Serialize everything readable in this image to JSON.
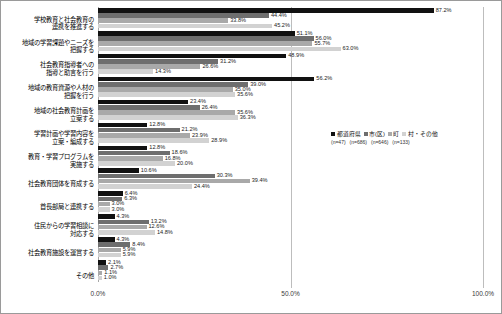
{
  "chart_data": {
    "type": "bar",
    "orientation": "horizontal",
    "title": "",
    "xlabel": "",
    "ylabel": "",
    "xlim": [
      0,
      100
    ],
    "xticks": [
      "0.0%",
      "50.0%",
      "100.0%"
    ],
    "xtick_values": [
      0,
      50,
      100
    ],
    "grid": true,
    "legend_position": "right-middle",
    "categories": [
      "学校教育と社会教育の\n連携を推進する",
      "地域の学習課題やニーズを\n把握する",
      "社会教育指導者への\n指導と助言を行う",
      "地域の教育資源や人材の\n把握を行う",
      "地域の社会教育計画を\n立案する",
      "学習計画や学習内容を\n立案・編成する",
      "教育・学習プログラムを\n実施する",
      "社会教育団体を育成する",
      "首長部局と連携する",
      "住民からの学習相談に\n対応する",
      "社会教育施設を運営する",
      "その他"
    ],
    "series": [
      {
        "name": "都道府県",
        "n_label": "(n=47)",
        "color": "#111111",
        "values": [
          87.2,
          51.1,
          48.9,
          56.2,
          23.4,
          12.8,
          12.8,
          10.6,
          6.4,
          4.3,
          4.3,
          2.1
        ],
        "value_labels": [
          "87.2%",
          "51.1%",
          "48.9%",
          "56.2%",
          "23.4%",
          "12.8%",
          "12.8%",
          "10.6%",
          "6.4%",
          "4.3%",
          "4.3%",
          "2.1%"
        ]
      },
      {
        "name": "市(区)",
        "n_label": "(n=686)",
        "color": "#6e6e6e",
        "values": [
          44.4,
          56.0,
          31.2,
          39.0,
          26.4,
          21.2,
          18.6,
          30.3,
          6.3,
          13.2,
          8.4,
          2.7
        ],
        "value_labels": [
          "44.4%",
          "56.0%",
          "31.2%",
          "39.0%",
          "26.4%",
          "21.2%",
          "18.6%",
          "30.3%",
          "6.3%",
          "13.2%",
          "8.4%",
          "2.7%"
        ]
      },
      {
        "name": "町",
        "n_label": "(n=646)",
        "color": "#a9a9a9",
        "values": [
          33.8,
          55.7,
          26.6,
          35.0,
          35.6,
          23.9,
          16.8,
          39.4,
          3.0,
          12.6,
          5.9,
          1.1
        ],
        "value_labels": [
          "33.8%",
          "55.7%",
          "26.6%",
          "35.0%",
          "35.6%",
          "23.9%",
          "16.8%",
          "39.4%",
          "3.0%",
          "12.6%",
          "5.9%",
          "1.1%"
        ]
      },
      {
        "name": "村・その他",
        "n_label": "(n=133)",
        "color": "#d2d2d2",
        "values": [
          45.2,
          63.0,
          14.3,
          35.6,
          36.3,
          28.9,
          20.0,
          24.4,
          3.0,
          14.8,
          5.9,
          1.0
        ],
        "value_labels": [
          "45.2%",
          "63.0%",
          "14.3%",
          "35.6%",
          "36.3%",
          "28.9%",
          "20.0%",
          "24.4%",
          "3.0%",
          "14.8%",
          "5.9%",
          "1.0%"
        ]
      }
    ]
  }
}
